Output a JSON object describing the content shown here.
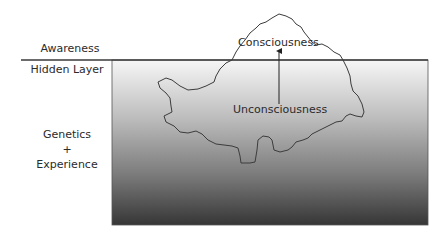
{
  "diagram": {
    "type": "iceberg-metaphor",
    "labels": {
      "awareness": "Awareness",
      "hidden_layer": "Hidden Layer",
      "genetics": "Genetics",
      "plus": "+",
      "experience": "Experience",
      "consciousness": "Consciousness",
      "unconsciousness": "Unconsciousness"
    },
    "colors": {
      "gradient_top": "#f6f6f6",
      "gradient_bottom": "#363636",
      "outline": "#3c3c3c",
      "text": "#2b2b2b"
    }
  }
}
